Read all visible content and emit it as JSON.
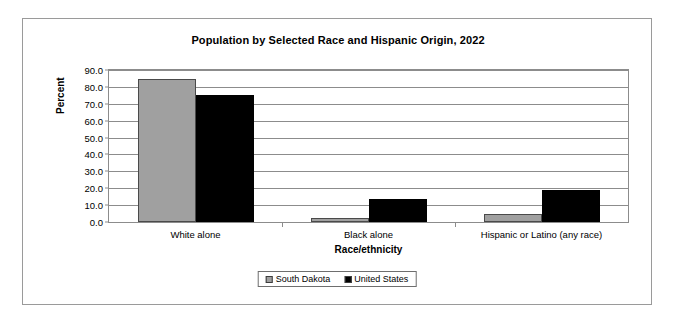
{
  "chart_data": {
    "type": "bar",
    "title": "Population by Selected Race and Hispanic Origin, 2022",
    "xlabel": "Race/ethnicity",
    "ylabel": "Percent",
    "categories": [
      "White alone",
      "Black alone",
      "Hispanic or Latino (any race)"
    ],
    "series": [
      {
        "name": "South Dakota",
        "color": "#a0a0a0",
        "values": [
          84.8,
          2.3,
          4.7
        ]
      },
      {
        "name": "United States",
        "color": "#000000",
        "values": [
          75.5,
          13.6,
          19.1
        ]
      }
    ],
    "ylim": [
      0.0,
      90.0
    ],
    "ytick_step": 10.0,
    "ytick_labels": [
      "0.0",
      "10.0",
      "20.0",
      "30.0",
      "40.0",
      "50.0",
      "60.0",
      "70.0",
      "80.0",
      "90.0"
    ],
    "grid": true,
    "legend_position": "bottom"
  }
}
